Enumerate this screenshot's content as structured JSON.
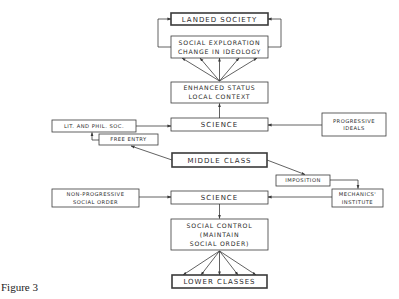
{
  "figure": {
    "caption": "Figure 3",
    "colors": {
      "line": "#3a3a3a",
      "text": "#2a2a2a",
      "background": "#ffffff"
    }
  },
  "nodes": {
    "landed_society": {
      "lines": [
        "LANDED SOCIETY"
      ],
      "emphasis": "bold"
    },
    "social_exploration": {
      "lines": [
        "SOCIAL EXPLORATION",
        "CHANGE IN IDEOLOGY"
      ]
    },
    "enhanced_status": {
      "lines": [
        "ENHANCED STATUS",
        "LOCAL CONTEXT"
      ]
    },
    "science_upper": {
      "lines": [
        "SCIENCE"
      ]
    },
    "lit_phil_soc": {
      "lines": [
        "LIT. AND PHIL. SOC."
      ]
    },
    "free_entry": {
      "lines": [
        "FREE ENTRY"
      ]
    },
    "progressive_ideals": {
      "lines": [
        "PROGRESSIVE",
        "IDEALS"
      ]
    },
    "middle_class": {
      "lines": [
        "MIDDLE CLASS"
      ],
      "emphasis": "bold"
    },
    "imposition": {
      "lines": [
        "IMPOSITION"
      ]
    },
    "mechanics_institute": {
      "lines": [
        "MECHANICS'",
        "INSTITUTE"
      ]
    },
    "non_progressive": {
      "lines": [
        "NON-PROGRESSIVE",
        "SOCIAL ORDER"
      ]
    },
    "science_lower": {
      "lines": [
        "SCIENCE"
      ]
    },
    "social_control": {
      "lines": [
        "SOCIAL CONTROL",
        "(MAINTAIN",
        "SOCIAL ORDER)"
      ]
    },
    "lower_classes": {
      "lines": [
        "LOWER CLASSES"
      ],
      "emphasis": "bold"
    }
  },
  "edges": [
    {
      "from": "social_exploration",
      "to": "landed_society",
      "label": "feedback-left"
    },
    {
      "from": "social_exploration",
      "to": "landed_society",
      "label": "feedback-right"
    },
    {
      "from": "enhanced_status",
      "to": "social_exploration",
      "count": 5
    },
    {
      "from": "science_upper",
      "to": "enhanced_status"
    },
    {
      "from": "lit_phil_soc",
      "to": "science_upper"
    },
    {
      "from": "progressive_ideals",
      "to": "science_upper"
    },
    {
      "from": "free_entry",
      "to": "lit_phil_soc"
    },
    {
      "from": "middle_class",
      "to": "free_entry"
    },
    {
      "from": "middle_class",
      "to": "imposition"
    },
    {
      "from": "imposition",
      "to": "mechanics_institute"
    },
    {
      "from": "mechanics_institute",
      "to": "science_lower"
    },
    {
      "from": "non_progressive",
      "to": "science_lower"
    },
    {
      "from": "science_lower",
      "to": "social_control"
    },
    {
      "from": "social_control",
      "to": "lower_classes",
      "count": 5
    }
  ]
}
